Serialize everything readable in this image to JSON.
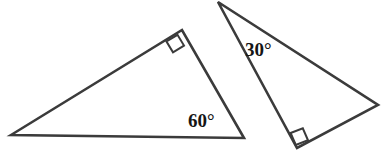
{
  "figure": {
    "background_color": "#ffffff",
    "stroke_color": "#3b3b3b",
    "text_color": "#161616",
    "width": 386,
    "height": 151,
    "shapes": [
      {
        "name": "left-triangle",
        "type": "right-triangle",
        "vertices": [
          {
            "name": "left-vertex",
            "x": 11,
            "y": 135
          },
          {
            "name": "apex-vertex",
            "x": 182,
            "y": 30
          },
          {
            "name": "bottom-right-vertex",
            "x": 244,
            "y": 138
          }
        ],
        "right_angle_at": "apex-vertex",
        "right_angle_marker": {
          "points": "166.5,41.5 177.5,34.8 184.0,45.6 173.0,52.3"
        },
        "labels": [
          {
            "name": "angle-label-60",
            "text": "60°",
            "value": 60,
            "unit": "degrees",
            "at_vertex": "bottom-right-vertex",
            "x": 188,
            "y": 127
          }
        ]
      },
      {
        "name": "right-triangle",
        "type": "right-triangle",
        "vertices": [
          {
            "name": "top-vertex",
            "x": 218,
            "y": 2
          },
          {
            "name": "right-vertex",
            "x": 378,
            "y": 105
          },
          {
            "name": "bottom-vertex",
            "x": 297,
            "y": 148
          }
        ],
        "right_angle_at": "bottom-vertex",
        "right_angle_marker": {
          "points": "290.6,133.0 302.8,128.3 308.0,140.3 295.8,145.0"
        },
        "labels": [
          {
            "name": "angle-label-30",
            "text": "30°",
            "value": 30,
            "unit": "degrees",
            "at_vertex": "top-vertex",
            "x": 245,
            "y": 56
          }
        ]
      }
    ]
  }
}
